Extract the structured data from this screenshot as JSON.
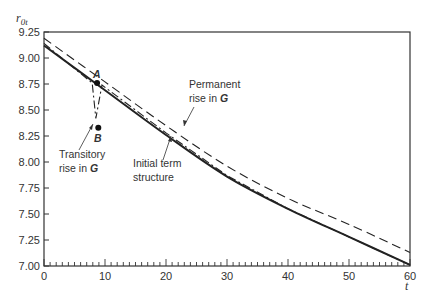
{
  "chart_data": {
    "type": "line",
    "title": "",
    "xlabel": "t",
    "ylabel": "r0t",
    "xlim": [
      0,
      60
    ],
    "ylim": [
      7.0,
      9.25
    ],
    "grid": false,
    "legend": null,
    "x_ticks": [
      0,
      10,
      20,
      30,
      40,
      50,
      60
    ],
    "x_minor_step": 1,
    "y_ticks": [
      7.0,
      7.25,
      7.5,
      7.75,
      8.0,
      8.25,
      8.5,
      8.75,
      9.0,
      9.25
    ],
    "y_tick_labels": [
      "7.00",
      "7.25",
      "7.50",
      "7.75",
      "8.00",
      "8.25",
      "8.50",
      "8.75",
      "9.00",
      "9.25"
    ],
    "x_tick_labels": [
      "0",
      "10",
      "20",
      "30",
      "40",
      "50",
      "60"
    ],
    "series": [
      {
        "name": "Initial term structure",
        "style": "solid",
        "points": [
          [
            0,
            9.12
          ],
          [
            10,
            8.69
          ],
          [
            20,
            8.26
          ],
          [
            30,
            7.86
          ],
          [
            40,
            7.55
          ],
          [
            50,
            7.28
          ],
          [
            60,
            7.01
          ]
        ]
      },
      {
        "name": "Permanent rise in G",
        "style": "dashed",
        "points": [
          [
            0,
            9.19
          ],
          [
            10,
            8.77
          ],
          [
            20,
            8.35
          ],
          [
            30,
            7.96
          ],
          [
            40,
            7.65
          ],
          [
            50,
            7.4
          ],
          [
            60,
            7.13
          ]
        ]
      },
      {
        "name": "Transitory rise in G",
        "style": "dashdot",
        "points": [
          [
            0,
            9.14
          ],
          [
            7.9,
            8.76
          ],
          [
            8.5,
            8.42
          ],
          [
            9.5,
            8.74
          ],
          [
            20,
            8.28
          ],
          [
            30,
            7.87
          ],
          [
            40,
            7.55
          ],
          [
            50,
            7.28
          ],
          [
            60,
            7.01
          ]
        ]
      }
    ],
    "points": [
      {
        "label": "A",
        "t": 8.7,
        "r": 8.76
      },
      {
        "label": "B",
        "t": 8.9,
        "r": 8.33
      }
    ],
    "annotations": [
      {
        "text_lines": [
          "Permanent",
          "rise in G"
        ],
        "target": "dashed curve",
        "arrow_to": [
          21,
          8.28
        ]
      },
      {
        "text_lines": [
          "Transitory",
          "rise in G"
        ],
        "target": "dashdot dip",
        "arrow_to": [
          8.4,
          8.44
        ]
      },
      {
        "text_lines": [
          "Initial term",
          "structure"
        ],
        "target": "solid curve",
        "arrow_to": [
          21.5,
          8.22
        ]
      }
    ]
  },
  "labels": {
    "y_axis": "r",
    "y_axis_sub": "0t",
    "x_axis": "t",
    "point_a": "A",
    "point_b": "B",
    "permanent_1": "Permanent",
    "permanent_2": "rise in ",
    "permanent_g": "G",
    "transitory_1": "Transitory",
    "transitory_2": "rise in ",
    "transitory_g": "G",
    "initial_1": "Initial term",
    "initial_2": "structure"
  }
}
